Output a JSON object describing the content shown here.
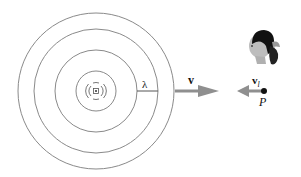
{
  "diagram": {
    "type": "doppler-effect-wavefronts",
    "source": {
      "icon": "sound-source-icon",
      "center": [
        96,
        91
      ]
    },
    "wavefronts": {
      "count": 4,
      "radii": [
        20,
        41,
        62,
        78
      ],
      "stroke": "#8a8a8a"
    },
    "labels": {
      "wavelength": "λ",
      "wave_velocity": "v",
      "listener_velocity": "v",
      "listener_velocity_sub": "l",
      "point": "P"
    },
    "arrows": {
      "wave_velocity": {
        "direction": "right",
        "color": "#8f8f8f"
      },
      "listener_velocity": {
        "direction": "left",
        "color": "#8f8f8f"
      }
    },
    "listener": {
      "icon": "listener-head-icon"
    }
  }
}
